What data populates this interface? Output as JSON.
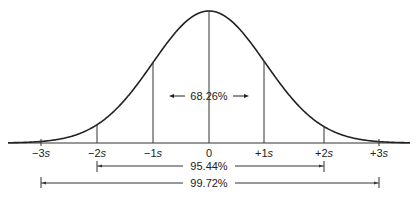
{
  "diagram": {
    "axis_labels": [
      {
        "text": "−3",
        "sym": "s",
        "x": 41
      },
      {
        "text": "−2",
        "sym": "s",
        "x": 97
      },
      {
        "text": "−1",
        "sym": "s",
        "x": 153
      },
      {
        "text": "0",
        "sym": "",
        "x": 209
      },
      {
        "text": "+1",
        "sym": "s",
        "x": 264
      },
      {
        "text": "+2",
        "sym": "s",
        "x": 324
      },
      {
        "text": "+3",
        "sym": "s",
        "x": 379
      }
    ],
    "intervals": [
      {
        "label": "68.26%",
        "range": "−1s to +1s"
      },
      {
        "label": "95.44%",
        "range": "−2s to +2s"
      },
      {
        "label": "99.72%",
        "range": "−3s to +3s"
      }
    ],
    "colors": {
      "line": "#222222",
      "background": "#ffffff"
    }
  }
}
